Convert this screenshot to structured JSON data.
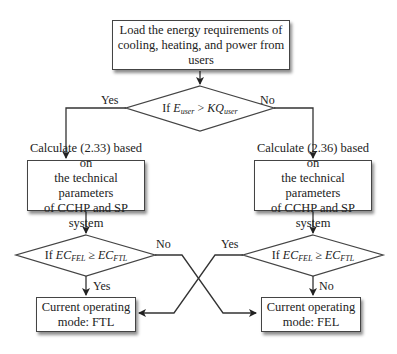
{
  "nodes": {
    "start": {
      "lines": [
        "Load the energy requirements of",
        "cooling, heating, and power from users"
      ]
    },
    "decision_main": {
      "prefix": "If ",
      "lhs": "E",
      "lhs_sub": "user",
      "op": " > ",
      "rhs": "KQ",
      "rhs_sub": "user"
    },
    "calc_left": {
      "lines": [
        "Calculate (2.33) based on",
        "the technical parameters",
        "of CCHP and SP system"
      ]
    },
    "calc_right": {
      "lines": [
        "Calculate (2.36) based on",
        "the technical parameters",
        "of CCHP and SP system"
      ]
    },
    "decision_left": {
      "prefix": "If ",
      "lhs": "EC",
      "lhs_sub": "FEL",
      "op": " ≥ ",
      "rhs": "EC",
      "rhs_sub": "FTL"
    },
    "decision_right": {
      "prefix": "If ",
      "lhs": "EC",
      "lhs_sub": "FEL",
      "op": " ≥ ",
      "rhs": "EC",
      "rhs_sub": "FTL"
    },
    "mode_ftl": {
      "lines": [
        "Current operating",
        "mode: FTL"
      ]
    },
    "mode_fel": {
      "lines": [
        "Current operating",
        "mode: FEL"
      ]
    }
  },
  "edges": {
    "main_yes": "Yes",
    "main_no": "No",
    "left_no": "No",
    "left_yes": "Yes",
    "right_yes": "Yes",
    "right_no": "No"
  }
}
